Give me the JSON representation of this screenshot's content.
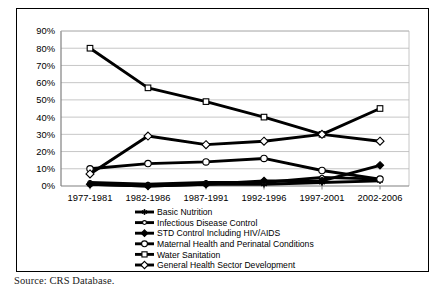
{
  "source_note": "Source: CRS Database.",
  "chart_data": {
    "type": "line",
    "title": "",
    "xlabel": "",
    "ylabel": "",
    "categories": [
      "1977-1981",
      "1982-1986",
      "1987-1991",
      "1992-1996",
      "1997-2001",
      "2002-2006"
    ],
    "ylim": [
      0,
      90
    ],
    "ytick_labels": [
      "0%",
      "10%",
      "20%",
      "30%",
      "40%",
      "50%",
      "60%",
      "70%",
      "80%",
      "90%"
    ],
    "ytick_values": [
      0,
      10,
      20,
      30,
      40,
      50,
      60,
      70,
      80,
      90
    ],
    "grid": true,
    "legend_position": "bottom",
    "series": [
      {
        "name": "Basic Nutrition",
        "marker": "asterisk",
        "color": "#000000",
        "values": [
          1,
          0,
          1,
          1,
          2,
          3
        ]
      },
      {
        "name": "Infectious Disease Control",
        "marker": "open-circle-small",
        "color": "#000000",
        "values": [
          2,
          1,
          2,
          2,
          5,
          4
        ]
      },
      {
        "name": "STD Control Including HIV/AIDS",
        "marker": "filled-diamond",
        "color": "#000000",
        "values": [
          1,
          0,
          1,
          3,
          3,
          12
        ]
      },
      {
        "name": "Maternal Health and Perinatal Conditions",
        "marker": "open-circle",
        "color": "#000000",
        "values": [
          10,
          13,
          14,
          16,
          9,
          4
        ]
      },
      {
        "name": "Water Sanitation",
        "marker": "open-square",
        "color": "#000000",
        "values": [
          80,
          57,
          49,
          40,
          30,
          45
        ]
      },
      {
        "name": "General Health Sector Development",
        "marker": "open-diamond",
        "color": "#000000",
        "values": [
          7,
          29,
          24,
          26,
          30,
          26
        ]
      }
    ]
  }
}
